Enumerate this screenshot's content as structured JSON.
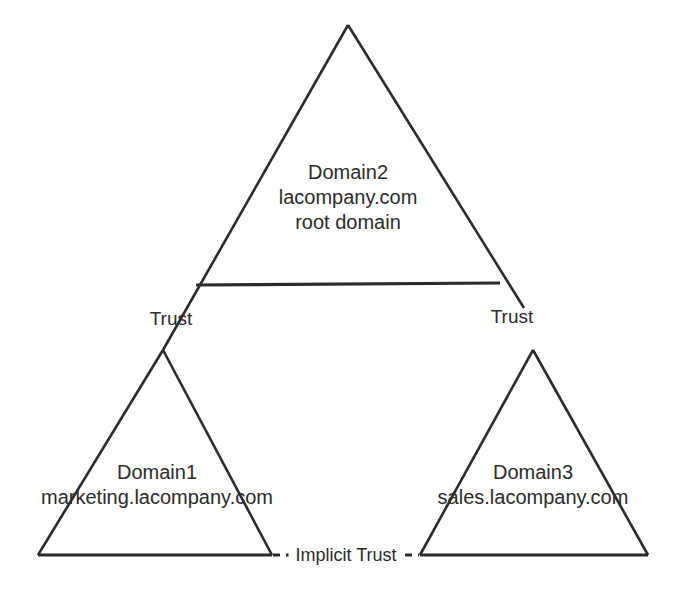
{
  "diagram": {
    "background_color": "#ffffff",
    "line_color": "#2b2b2b",
    "text_color": "#2b2b2b",
    "nodes": [
      {
        "id": "domain2",
        "shape": "triangle",
        "name": "Domain2",
        "dns": "lacompany.com",
        "role": "root domain"
      },
      {
        "id": "domain1",
        "shape": "triangle",
        "name": "Domain1",
        "dns": "marketing.lacompany.com",
        "role": ""
      },
      {
        "id": "domain3",
        "shape": "triangle",
        "name": "Domain3",
        "dns": "sales.lacompany.com",
        "role": ""
      }
    ],
    "connectors": [
      {
        "id": "trust-left",
        "label": "Trust",
        "style": "solid"
      },
      {
        "id": "trust-right",
        "label": "Trust",
        "style": "solid"
      },
      {
        "id": "implicit-trust",
        "label": "Implicit Trust",
        "style": "dashed"
      }
    ]
  }
}
